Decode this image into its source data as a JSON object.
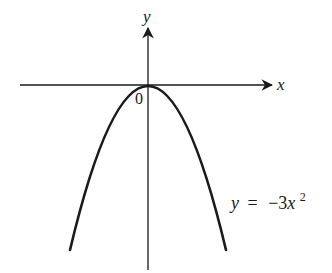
{
  "figure": {
    "type": "graph-of-function",
    "axes": {
      "x_label": "x",
      "y_label": "y",
      "origin_label": "0"
    },
    "curve": {
      "equation_lhs": "y",
      "equation_eq": "=",
      "equation_rhs_base": "−3x",
      "equation_rhs_exp": "2",
      "equation_text": "y = −3x²",
      "shape": "downward-opening parabola",
      "vertex": [
        0,
        0
      ]
    },
    "colors": {
      "stroke": "#1a1a1a",
      "background": "#ffffff"
    }
  }
}
